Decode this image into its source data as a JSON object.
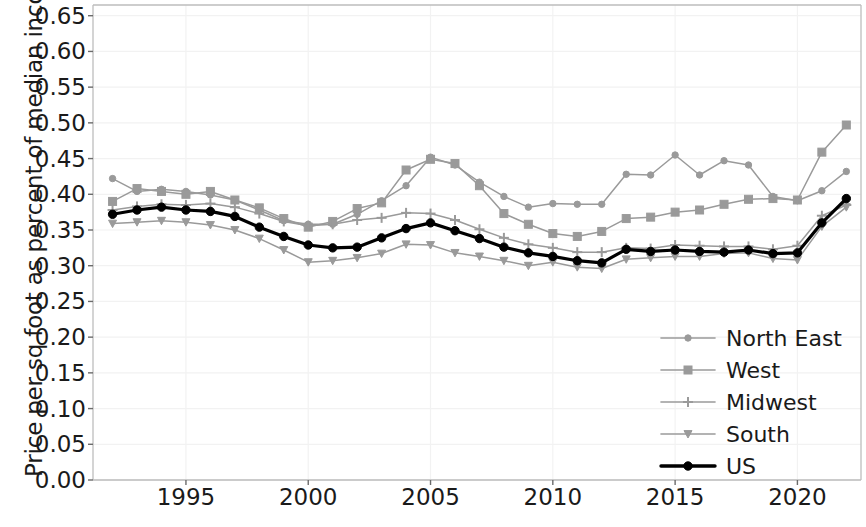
{
  "chart_data": {
    "type": "line",
    "title": "",
    "xlabel": "",
    "ylabel": "Price per sq foot as percent of median income",
    "xlim": [
      1991.2,
      2022.6
    ],
    "ylim": [
      0.0,
      0.665
    ],
    "grid": true,
    "legend_position": "lower right",
    "x_ticks": [
      "1995",
      "2000",
      "2005",
      "2010",
      "2015",
      "2020"
    ],
    "x_tick_values": [
      1995,
      2000,
      2005,
      2010,
      2015,
      2020
    ],
    "y_ticks": [
      "0.00",
      "0.05",
      "0.10",
      "0.15",
      "0.20",
      "0.25",
      "0.30",
      "0.35",
      "0.40",
      "0.45",
      "0.50",
      "0.55",
      "0.60",
      "0.65"
    ],
    "y_tick_values": [
      0.0,
      0.05,
      0.1,
      0.15,
      0.2,
      0.25,
      0.3,
      0.35,
      0.4,
      0.45,
      0.5,
      0.55,
      0.6,
      0.65
    ],
    "x": [
      1992,
      1993,
      1994,
      1995,
      1996,
      1997,
      1998,
      1999,
      2000,
      2001,
      2002,
      2003,
      2004,
      2005,
      2006,
      2007,
      2008,
      2009,
      2010,
      2011,
      2012,
      2013,
      2014,
      2015,
      2016,
      2017,
      2018,
      2019,
      2020,
      2021,
      2022
    ],
    "series": [
      {
        "name": "North East",
        "marker": "circle",
        "color": "#9a9a9a",
        "values": [
          0.422,
          0.404,
          0.407,
          0.404,
          0.399,
          0.392,
          0.378,
          0.363,
          0.358,
          0.358,
          0.372,
          0.391,
          0.412,
          0.452,
          0.441,
          0.417,
          0.397,
          0.382,
          0.387,
          0.386,
          0.386,
          0.428,
          0.427,
          0.455,
          0.427,
          0.447,
          0.441,
          0.397,
          0.391,
          0.405,
          0.432
        ]
      },
      {
        "name": "West",
        "marker": "square",
        "color": "#9a9a9a",
        "values": [
          0.39,
          0.408,
          0.404,
          0.4,
          0.404,
          0.392,
          0.381,
          0.366,
          0.354,
          0.362,
          0.38,
          0.388,
          0.434,
          0.449,
          0.443,
          0.412,
          0.373,
          0.358,
          0.345,
          0.341,
          0.348,
          0.366,
          0.368,
          0.375,
          0.378,
          0.386,
          0.393,
          0.394,
          0.392,
          0.459,
          0.497
        ]
      },
      {
        "name": "Midwest",
        "marker": "plus",
        "color": "#9a9a9a",
        "values": [
          0.378,
          0.383,
          0.386,
          0.385,
          0.387,
          0.382,
          0.373,
          0.362,
          0.356,
          0.358,
          0.364,
          0.367,
          0.374,
          0.373,
          0.364,
          0.351,
          0.339,
          0.33,
          0.325,
          0.319,
          0.319,
          0.325,
          0.324,
          0.329,
          0.328,
          0.327,
          0.327,
          0.323,
          0.328,
          0.37,
          0.385
        ]
      },
      {
        "name": "South",
        "marker": "triangle-down",
        "color": "#9a9a9a",
        "values": [
          0.359,
          0.361,
          0.363,
          0.361,
          0.357,
          0.35,
          0.338,
          0.322,
          0.305,
          0.307,
          0.311,
          0.317,
          0.33,
          0.329,
          0.318,
          0.313,
          0.307,
          0.3,
          0.305,
          0.298,
          0.296,
          0.309,
          0.311,
          0.313,
          0.313,
          0.317,
          0.318,
          0.31,
          0.308,
          0.355,
          0.382
        ]
      },
      {
        "name": "US",
        "marker": "circle-bold",
        "color": "#000000",
        "values": [
          0.372,
          0.378,
          0.382,
          0.378,
          0.376,
          0.369,
          0.354,
          0.341,
          0.329,
          0.325,
          0.326,
          0.339,
          0.352,
          0.36,
          0.349,
          0.338,
          0.326,
          0.318,
          0.313,
          0.307,
          0.304,
          0.323,
          0.32,
          0.322,
          0.32,
          0.319,
          0.322,
          0.317,
          0.318,
          0.36,
          0.394
        ]
      }
    ]
  },
  "legend": {
    "entries": [
      {
        "label": "North East"
      },
      {
        "label": "West"
      },
      {
        "label": "Midwest"
      },
      {
        "label": "South"
      },
      {
        "label": "US"
      }
    ]
  }
}
